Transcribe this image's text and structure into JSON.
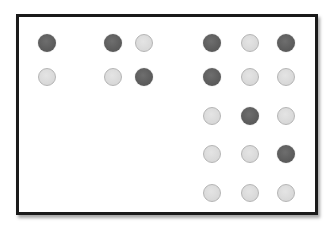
{
  "colors": {
    "frame_border": "#1a1a1a",
    "background": "#ffffff",
    "dot_dark": "#5c5c5c",
    "dot_light": "#d8d8d8",
    "dot_light_border": "#b5b5b5"
  },
  "grid": {
    "columns": [
      47,
      113,
      144,
      212,
      250,
      286
    ],
    "rows": [
      43,
      77,
      116,
      154,
      193
    ],
    "cells": [
      [
        "dark",
        "dark",
        "light",
        "dark",
        "light",
        "dark"
      ],
      [
        "light",
        "light",
        "dark",
        "dark",
        "light",
        "light"
      ],
      [
        null,
        null,
        null,
        "light",
        "dark",
        "light"
      ],
      [
        null,
        null,
        null,
        "light",
        "light",
        "dark"
      ],
      [
        null,
        null,
        null,
        "light",
        "light",
        "light"
      ]
    ]
  }
}
